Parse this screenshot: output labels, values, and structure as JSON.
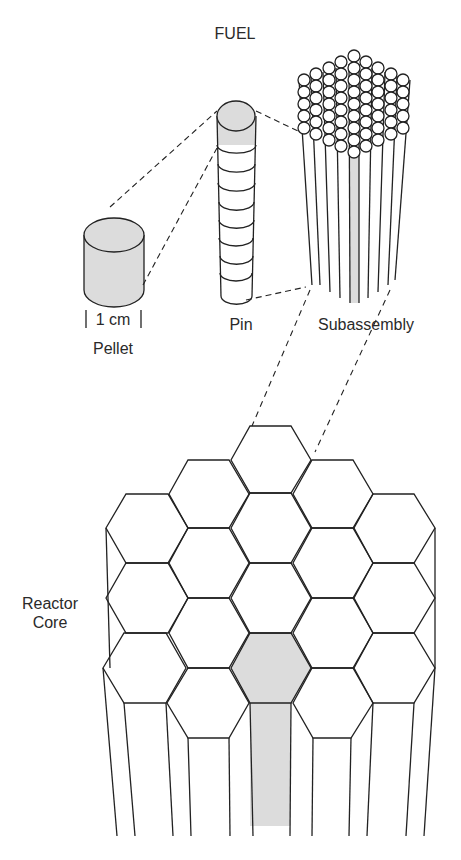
{
  "title": "FUEL",
  "labels": {
    "scale": "1 cm",
    "pellet": "Pellet",
    "pin": "Pin",
    "subassembly": "Subassembly",
    "core_line1": "Reactor",
    "core_line2": "Core"
  },
  "colors": {
    "line": "#222222",
    "highlight": "#dcdcdc",
    "background": "#ffffff"
  }
}
